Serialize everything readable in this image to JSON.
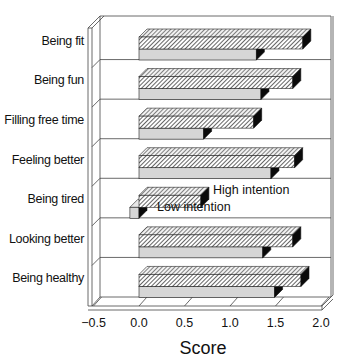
{
  "chart_data": {
    "type": "bar",
    "orientation": "horizontal",
    "style": "3d",
    "title": "",
    "xlabel": "Score",
    "ylabel": "",
    "xlim": [
      -0.5,
      2.0
    ],
    "xticks": [
      -0.5,
      0.0,
      0.5,
      1.0,
      1.5,
      2.0
    ],
    "xtick_labels": [
      "−0.5",
      "0.0",
      "0.5",
      "1.0",
      "1.5",
      "2.0"
    ],
    "grid": "horizontal row separators",
    "categories": [
      "Being fit",
      "Being fun",
      "Filling free time",
      "Feeling better",
      "Being tired",
      "Looking better",
      "Being healthy"
    ],
    "series": [
      {
        "name": "High intention",
        "pattern": "hatched",
        "values": [
          1.8,
          1.69,
          1.26,
          1.71,
          0.68,
          1.69,
          1.78
        ]
      },
      {
        "name": "Low intention",
        "pattern": "light-gray",
        "values": [
          1.29,
          1.34,
          0.71,
          1.45,
          -0.1,
          1.36,
          1.49
        ]
      }
    ],
    "annotations": [
      {
        "text": "High intention",
        "row": "Being tired",
        "target_series": "High intention"
      },
      {
        "text": "Low intention",
        "row": "Being tired",
        "target_series": "Low intention"
      }
    ],
    "legend_position": "inline annotations on 'Being tired' row"
  },
  "colors": {
    "high_fill": "#ffffff",
    "high_hatch": "#222222",
    "low_fill": "#d6d6d6",
    "side_face": "#0a0a0a",
    "frame": "#444444"
  }
}
